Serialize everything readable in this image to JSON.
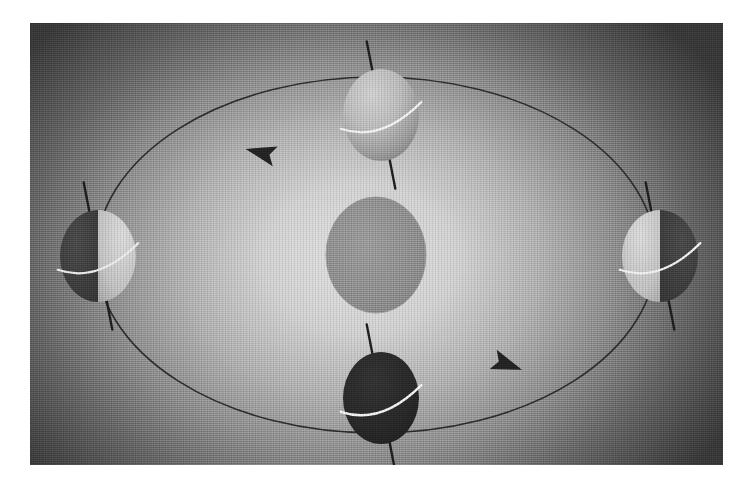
{
  "figure": {
    "caption": "",
    "panel": {
      "x": 30,
      "y": 23,
      "width": 693,
      "height": 442
    },
    "background": {
      "type": "radial-gradient",
      "center_color": "#dedede",
      "mid_color": "#9a9a9a",
      "edge_color": "#3a3a3a",
      "center_x": 330,
      "center_y": 235,
      "radius_x": 430,
      "radius_y": 330
    },
    "texture": "halftone-dither-scan"
  },
  "sun": {
    "label": "Sun",
    "center_x": 346,
    "center_y": 232,
    "radius_x": 50,
    "radius_y": 58,
    "fill_color": "#8f8f8f",
    "edge_color": "#9d9d9d"
  },
  "orbit": {
    "label": "Orbital path of Earth",
    "center_x": 346,
    "center_y": 232,
    "radius_x": 280,
    "radius_y": 178,
    "stroke_color": "#2e2e2e",
    "stroke_width": 1.6,
    "direction": "counterclockwise"
  },
  "arrows": [
    {
      "name": "orbit-direction-arrow-top",
      "x": 232,
      "y": 130,
      "rotation": -166,
      "size": 17,
      "fill_color": "#242424"
    },
    {
      "name": "orbit-direction-arrow-bottom",
      "x": 476,
      "y": 341,
      "rotation": 20,
      "size": 17,
      "fill_color": "#242424"
    }
  ],
  "earth_positions": [
    {
      "name": "earth-top",
      "season_hint": "northern-summer",
      "center_x": 351,
      "center_y": 92,
      "radius_x": 38,
      "radius_y": 46,
      "lit_side": "full-front",
      "lit_color": "#c2c2c2",
      "dark_color": "#6e6e6e",
      "terminator": "none",
      "axis": {
        "tilt_degrees": -11,
        "length": 150,
        "stroke_color": "#1f1f1f",
        "stroke_width": 2.4
      },
      "equator": {
        "stroke_color": "#f3f3f3",
        "stroke_width": 2.2,
        "tilt_degrees": -11,
        "sweep": "front"
      }
    },
    {
      "name": "earth-right",
      "season_hint": "equinox",
      "center_x": 630,
      "center_y": 233,
      "radius_x": 38,
      "radius_y": 46,
      "lit_side": "left",
      "lit_color": "#cfcfcf",
      "dark_color": "#454545",
      "terminator": "vertical",
      "axis": {
        "tilt_degrees": -11,
        "length": 150,
        "stroke_color": "#1f1f1f",
        "stroke_width": 2.4
      },
      "equator": {
        "stroke_color": "#f3f3f3",
        "stroke_width": 2.2,
        "tilt_degrees": -11,
        "sweep": "front"
      }
    },
    {
      "name": "earth-bottom",
      "season_hint": "northern-winter",
      "center_x": 351,
      "center_y": 375,
      "radius_x": 38,
      "radius_y": 46,
      "lit_side": "full-back",
      "lit_color": "#2a2a2a",
      "dark_color": "#232323",
      "terminator": "none",
      "axis": {
        "tilt_degrees": -11,
        "length": 150,
        "stroke_color": "#1f1f1f",
        "stroke_width": 2.4
      },
      "equator": {
        "stroke_color": "#f4f4f4",
        "stroke_width": 2.4,
        "tilt_degrees": -11,
        "sweep": "front"
      }
    },
    {
      "name": "earth-left",
      "season_hint": "equinox",
      "center_x": 68,
      "center_y": 233,
      "radius_x": 38,
      "radius_y": 46,
      "lit_side": "right",
      "lit_color": "#cacaca",
      "dark_color": "#3f3f3f",
      "terminator": "vertical",
      "axis": {
        "tilt_degrees": -11,
        "length": 150,
        "stroke_color": "#1f1f1f",
        "stroke_width": 2.4
      },
      "equator": {
        "stroke_color": "#ededed",
        "stroke_width": 2.2,
        "tilt_degrees": -11,
        "sweep": "front"
      }
    }
  ]
}
